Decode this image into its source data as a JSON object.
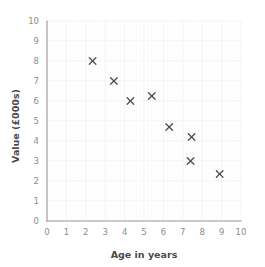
{
  "chart_data": {
    "type": "scatter",
    "title": "",
    "xlabel": "Age in years",
    "ylabel": "Value (£000s)",
    "xlim": [
      0,
      10
    ],
    "ylim": [
      0,
      10
    ],
    "x_ticks": [
      0,
      1,
      2,
      3,
      4,
      5,
      6,
      7,
      8,
      9,
      10
    ],
    "y_ticks": [
      0,
      1,
      2,
      3,
      4,
      5,
      6,
      7,
      8,
      9,
      10
    ],
    "x_tick_labels": [
      "0",
      "1",
      "2",
      "3",
      "4",
      "5",
      "6",
      "7",
      "8",
      "9",
      "10"
    ],
    "y_tick_labels": [
      "0",
      "1",
      "2",
      "3",
      "4",
      "5",
      "6",
      "7",
      "8",
      "9",
      "10"
    ],
    "grid": true,
    "grid_minor_per_unit": 5,
    "legend": null,
    "marker": "x",
    "marker_color": "#4d4d4d",
    "points": [
      {
        "x": 2.35,
        "y": 8.0
      },
      {
        "x": 3.45,
        "y": 7.0
      },
      {
        "x": 4.3,
        "y": 6.0
      },
      {
        "x": 5.4,
        "y": 6.25
      },
      {
        "x": 6.3,
        "y": 4.7
      },
      {
        "x": 7.45,
        "y": 4.2
      },
      {
        "x": 7.4,
        "y": 3.0
      },
      {
        "x": 8.9,
        "y": 2.35
      }
    ],
    "series": [
      {
        "name": "Value vs Age",
        "x": [
          2.35,
          3.45,
          4.3,
          5.4,
          6.3,
          7.45,
          7.4,
          8.9
        ],
        "values": [
          8.0,
          7.0,
          6.0,
          6.25,
          4.7,
          4.2,
          3.0,
          2.35
        ]
      }
    ]
  },
  "colors": {
    "axis": "#9a9a9a",
    "grid_major": "#eceff1",
    "grid_minor": "#f6f8f9",
    "tick_text": "#8c8c8c",
    "title_text": "#4a4a4a",
    "marker": "#4d4d4d",
    "background": "#ffffff"
  }
}
